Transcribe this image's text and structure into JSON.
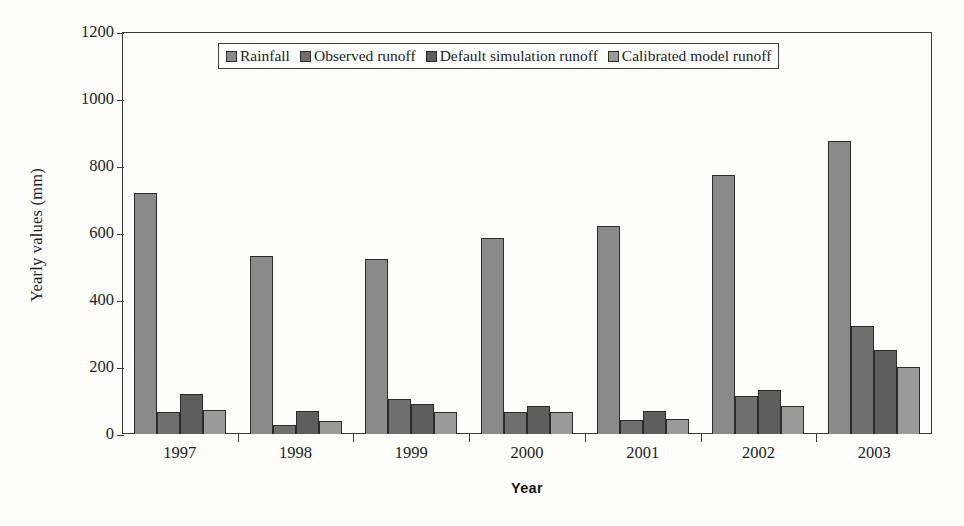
{
  "chart_data": {
    "type": "bar",
    "title": "",
    "subtitle": "",
    "xlabel": "Year",
    "ylabel": "Yearly values (mm)",
    "categories": [
      "1997",
      "1998",
      "1999",
      "2000",
      "2001",
      "2002",
      "2003"
    ],
    "ylim": [
      0,
      1200
    ],
    "yticks": [
      0,
      200,
      400,
      600,
      800,
      1000,
      1200
    ],
    "ytick_labels": [
      "0",
      "200",
      "400",
      "600",
      "800",
      "1000",
      "1200"
    ],
    "grid": false,
    "legend_position": "top-center",
    "series": [
      {
        "name": "Rainfall",
        "color": "#8a8a8a",
        "values": [
          718,
          532,
          522,
          585,
          620,
          773,
          876
        ]
      },
      {
        "name": "Observed runoff",
        "color": "#6f6f6f",
        "values": [
          65,
          28,
          105,
          65,
          42,
          112,
          322
        ]
      },
      {
        "name": "Default simulation runoff",
        "color": "#5e5e5e",
        "values": [
          120,
          70,
          90,
          85,
          68,
          130,
          252
        ]
      },
      {
        "name": "Calibrated model runoff",
        "color": "#9a9a9a",
        "values": [
          72,
          38,
          65,
          65,
          45,
          85,
          200
        ]
      }
    ]
  },
  "colors": {
    "axis": "#3a3a3a",
    "bar_outline": "#2b2b2b",
    "text": "#1c1c1c",
    "background": "#fdfdfc",
    "legend_border": "#3d3d3d"
  }
}
